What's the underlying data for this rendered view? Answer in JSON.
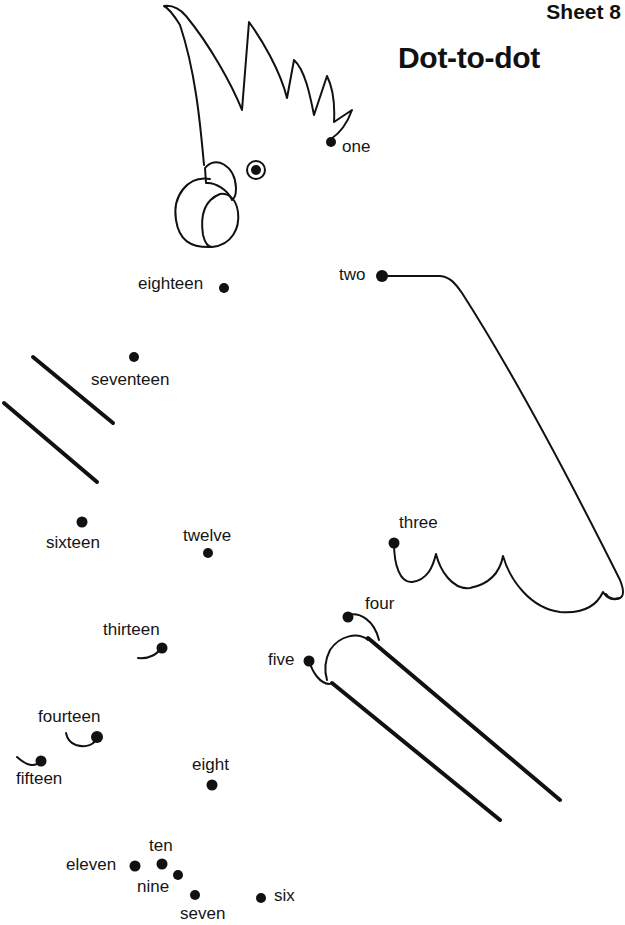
{
  "header": {
    "sheet": "Sheet 8",
    "title": "Dot-to-dot"
  },
  "dots": [
    {
      "n": 1,
      "label": "one"
    },
    {
      "n": 2,
      "label": "two"
    },
    {
      "n": 3,
      "label": "three"
    },
    {
      "n": 4,
      "label": "four"
    },
    {
      "n": 5,
      "label": "five"
    },
    {
      "n": 6,
      "label": "six"
    },
    {
      "n": 7,
      "label": "seven"
    },
    {
      "n": 8,
      "label": "eight"
    },
    {
      "n": 9,
      "label": "nine"
    },
    {
      "n": 10,
      "label": "ten"
    },
    {
      "n": 11,
      "label": "eleven"
    },
    {
      "n": 12,
      "label": "twelve"
    },
    {
      "n": 13,
      "label": "thirteen"
    },
    {
      "n": 14,
      "label": "fourteen"
    },
    {
      "n": 15,
      "label": "fifteen"
    },
    {
      "n": 16,
      "label": "sixteen"
    },
    {
      "n": 17,
      "label": "seventeen"
    },
    {
      "n": 18,
      "label": "eighteen"
    }
  ],
  "picture": {
    "subject": "cockatoo-outline",
    "ink_color": "#111111",
    "paper_color": "#ffffff"
  }
}
